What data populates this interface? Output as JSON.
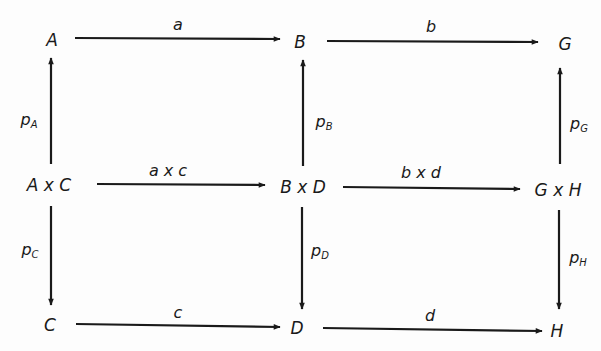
{
  "diagram": {
    "type": "commutative-diagram",
    "nodes": {
      "A": "A",
      "B": "B",
      "G": "G",
      "AxC": "A x C",
      "BxD": "B x D",
      "GxH": "G x H",
      "C": "C",
      "D": "D",
      "H": "H"
    },
    "arrows": {
      "a": {
        "label": "a",
        "from": "A",
        "to": "B"
      },
      "b": {
        "label": "b",
        "from": "B",
        "to": "G"
      },
      "axc": {
        "label": "a x c",
        "from": "A x C",
        "to": "B x D"
      },
      "bxd": {
        "label": "b x d",
        "from": "B x D",
        "to": "G x H"
      },
      "c": {
        "label": "c",
        "from": "C",
        "to": "D"
      },
      "d": {
        "label": "d",
        "from": "D",
        "to": "H"
      },
      "pA": {
        "label": "p",
        "sub": "A",
        "from": "A x C",
        "to": "A"
      },
      "pB": {
        "label": "p",
        "sub": "B",
        "from": "B x D",
        "to": "B"
      },
      "pG": {
        "label": "p",
        "sub": "G",
        "from": "G x H",
        "to": "G"
      },
      "pC": {
        "label": "p",
        "sub": "C",
        "from": "A x C",
        "to": "C"
      },
      "pD": {
        "label": "p",
        "sub": "D",
        "from": "B x D",
        "to": "D"
      },
      "pH": {
        "label": "p",
        "sub": "H",
        "from": "G x H",
        "to": "H"
      }
    },
    "colors": {
      "ink": "#1a1a1a",
      "background": "#fdfdfd"
    }
  }
}
